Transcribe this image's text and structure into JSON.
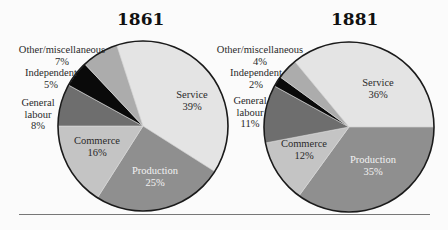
{
  "chart_data": [
    {
      "type": "pie",
      "title": "1861",
      "categories": [
        "Service",
        "Production",
        "Commerce",
        "General labour",
        "Independent",
        "Other/miscellaneous"
      ],
      "values": [
        39,
        25,
        16,
        8,
        5,
        7
      ],
      "unit": "%",
      "start_turn": -0.05,
      "direction": "clockwise",
      "colors": [
        "#e4e4e4",
        "#8f8f8f",
        "#c4c4c4",
        "#6e6e6e",
        "#0a0a0a",
        "#acacac"
      ],
      "labels": [
        "Service\n39%",
        "Production\n25%",
        "Commerce\n16%",
        "General\nlabour\n8%",
        "Independent\n5%",
        "Other/miscellaneous\n7%"
      ]
    },
    {
      "type": "pie",
      "title": "1881",
      "categories": [
        "Service",
        "Production",
        "Commerce",
        "General labour",
        "Independent",
        "Other/miscellaneous"
      ],
      "values": [
        36,
        35,
        12,
        11,
        2,
        4
      ],
      "unit": "%",
      "start_turn": -0.11,
      "direction": "clockwise",
      "colors": [
        "#e4e4e4",
        "#8f8f8f",
        "#c4c4c4",
        "#6e6e6e",
        "#0a0a0a",
        "#acacac"
      ],
      "labels": [
        "Service\n36%",
        "Production\n35%",
        "Commerce\n12%",
        "General\nlabour\n11%",
        "Independent\n2%",
        "Other/miscellaneous\n4%"
      ]
    }
  ],
  "charts": [
    {
      "title": "1861",
      "labels": {
        "service": "Service",
        "service_pct": "39%",
        "production": "Production",
        "production_pct": "25%",
        "commerce": "Commerce",
        "commerce_pct": "16%",
        "general": "General",
        "labour": "labour",
        "general_pct": "8%",
        "independent": "Independent",
        "independent_pct": "5%",
        "other": "Other/miscellaneous",
        "other_pct": "7%"
      }
    },
    {
      "title": "1881",
      "labels": {
        "service": "Service",
        "service_pct": "36%",
        "production": "Production",
        "production_pct": "35%",
        "commerce": "Commerce",
        "commerce_pct": "12%",
        "general": "General",
        "labour": "labour",
        "general_pct": "11%",
        "independent": "Independent",
        "independent_pct": "2%",
        "other": "Other/miscellaneous",
        "other_pct": "4%"
      }
    }
  ]
}
